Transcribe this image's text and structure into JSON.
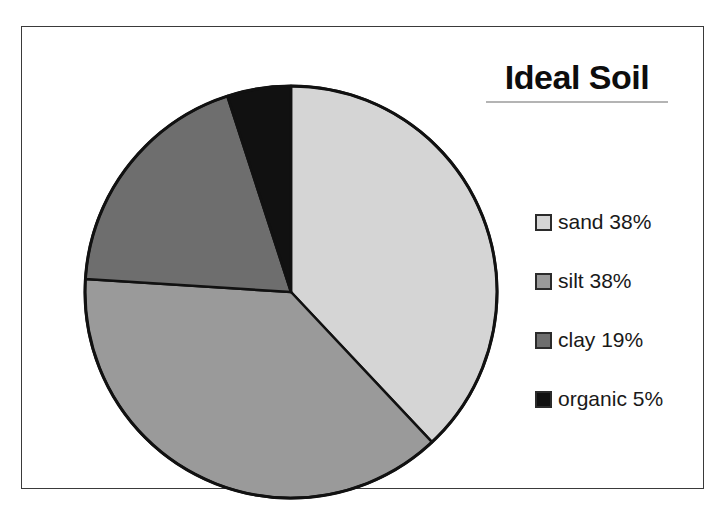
{
  "title": {
    "text": "Ideal Soil"
  },
  "chart_data": {
    "type": "pie",
    "title": "Ideal Soil",
    "xlabel": "",
    "ylabel": "",
    "legend_position": "right",
    "grid": false,
    "units": "percent",
    "start_angle_deg": 0,
    "direction": "clockwise",
    "categories": [
      "sand",
      "silt",
      "clay",
      "organic"
    ],
    "values": [
      38,
      38,
      19,
      5
    ],
    "labels": [
      "sand 38%",
      "silt 38%",
      "clay 19%",
      "organic 5%"
    ],
    "colors": [
      "#d5d5d5",
      "#9a9a9a",
      "#6e6e6e",
      "#111111"
    ],
    "slices": [
      {
        "name": "sand",
        "value": 38,
        "label": "sand 38%",
        "color": "#d5d5d5"
      },
      {
        "name": "silt",
        "value": 38,
        "label": "silt 38%",
        "color": "#9a9a9a"
      },
      {
        "name": "clay",
        "value": 19,
        "label": "clay 19%",
        "color": "#6e6e6e"
      },
      {
        "name": "organic",
        "value": 5,
        "label": "organic 5%",
        "color": "#111111"
      }
    ]
  },
  "legend": {
    "items": [
      {
        "label": "sand 38%",
        "color": "#d5d5d5"
      },
      {
        "label": "silt 38%",
        "color": "#9a9a9a"
      },
      {
        "label": "clay 19%",
        "color": "#6e6e6e"
      },
      {
        "label": "organic 5%",
        "color": "#111111"
      }
    ]
  },
  "style": {
    "frame_color": "#3a3a3a",
    "slice_outline_color": "#111111",
    "background": "#ffffff",
    "title_underline_color": "#b4b4b4"
  }
}
